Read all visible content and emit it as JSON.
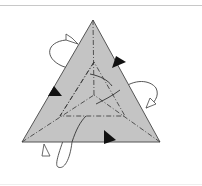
{
  "diagram": {
    "colors": {
      "face_fill": "#c4c4c4",
      "edge": "#555555",
      "axis_line": "#333333",
      "arrow": "#111111",
      "divider": "#c8c8c8"
    },
    "outer_triangle": {
      "apex": [
        93,
        20
      ],
      "bottom_left": [
        22,
        142
      ],
      "bottom_right": [
        160,
        142
      ]
    },
    "inner_center": [
      94,
      95
    ],
    "rotation_loops": [
      {
        "position": "upper-left"
      },
      {
        "position": "right"
      },
      {
        "position": "bottom-left"
      }
    ],
    "arrows": [
      {
        "position": "upper-right-edge"
      },
      {
        "position": "left-edge"
      },
      {
        "position": "bottom-edge"
      }
    ]
  }
}
